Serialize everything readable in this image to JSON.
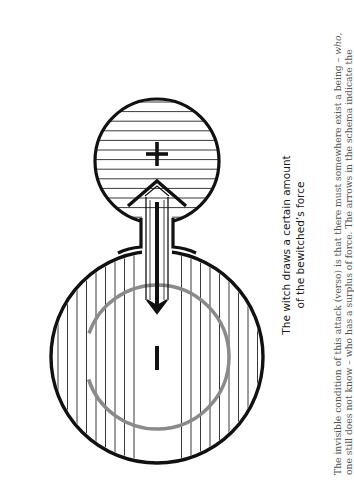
{
  "diagram": {
    "upper_region": {
      "label": "positive-force",
      "sign": "+",
      "hatching": "horizontal"
    },
    "lower_region": {
      "label": "negative-force",
      "sign": "−",
      "hatching": "vertical"
    },
    "arrows": [
      {
        "direction": "up",
        "style": "outline",
        "meaning": "force drawn toward witch"
      },
      {
        "direction": "down",
        "style": "solid",
        "meaning": "attack on bewitched"
      }
    ],
    "colors": {
      "stroke": "#111111",
      "inner_ring": "#8a8a8a",
      "background": "#ffffff"
    }
  },
  "caption": {
    "line1": "The witch draws a certain amount",
    "line2": "of the bewitched’s force"
  },
  "body_text": {
    "line1_a": "The invisible condition of this attack (verso) is that there must somewhere exist a being – ",
    "line1_em": "who,",
    "line2": "one still does not know – who has a surplus of force. The arrows in the schema indicate the"
  }
}
